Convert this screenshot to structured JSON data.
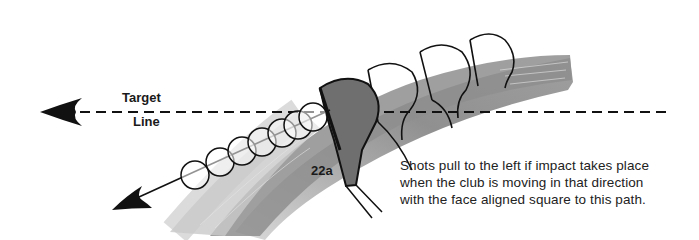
{
  "figure": {
    "id_label": "22a",
    "target_line_label": {
      "line1": "Target",
      "line2": "Line"
    },
    "caption": {
      "lines": [
        "Shots pull to the left if impact takes place",
        "when the club is moving in that direction",
        "with the face aligned square to this path."
      ]
    },
    "colors": {
      "swing_arc": "#8c8c8c",
      "club_head_fill": "#7a7a7a",
      "lines": "#111111",
      "background": "#ffffff"
    },
    "elements": {
      "target_line": "dashed-horizontal-arrow-left",
      "ball_path": "solid-diagonal-arrow-down-left",
      "balls_count": 7,
      "club_heads_count": 4
    }
  }
}
